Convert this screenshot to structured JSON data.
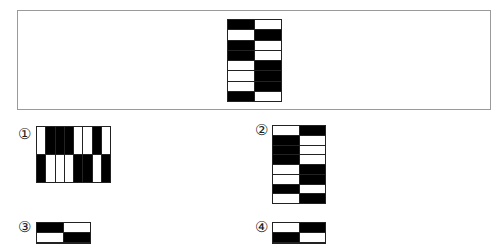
{
  "question_figure": {
    "columns": 2,
    "rows": 8,
    "cells": [
      [
        "B",
        "W"
      ],
      [
        "W",
        "B"
      ],
      [
        "B",
        "W"
      ],
      [
        "B",
        "W"
      ],
      [
        "W",
        "B"
      ],
      [
        "W",
        "B"
      ],
      [
        "W",
        "B"
      ],
      [
        "B",
        "W"
      ]
    ]
  },
  "options": [
    {
      "label": "①",
      "columns": 8,
      "rows": 2,
      "cells": [
        [
          "W",
          "B",
          "B",
          "B",
          "W",
          "W",
          "B",
          "W"
        ],
        [
          "B",
          "W",
          "W",
          "W",
          "B",
          "B",
          "W",
          "B"
        ]
      ]
    },
    {
      "label": "②",
      "columns": 2,
      "rows": 8,
      "cells": [
        [
          "W",
          "B"
        ],
        [
          "B",
          "W"
        ],
        [
          "B",
          "W"
        ],
        [
          "B",
          "W"
        ],
        [
          "W",
          "B"
        ],
        [
          "W",
          "B"
        ],
        [
          "B",
          "W"
        ],
        [
          "W",
          "B"
        ]
      ]
    },
    {
      "label": "③",
      "columns": 2,
      "rows": 2,
      "cells": [
        [
          "B",
          "W"
        ],
        [
          "W",
          "B"
        ]
      ]
    },
    {
      "label": "④",
      "columns": 2,
      "rows": 2,
      "cells": [
        [
          "W",
          "B"
        ],
        [
          "B",
          "W"
        ]
      ]
    }
  ],
  "colors": {
    "black": "#000000",
    "white": "#ffffff",
    "frame_border": "#9a9a9a"
  }
}
